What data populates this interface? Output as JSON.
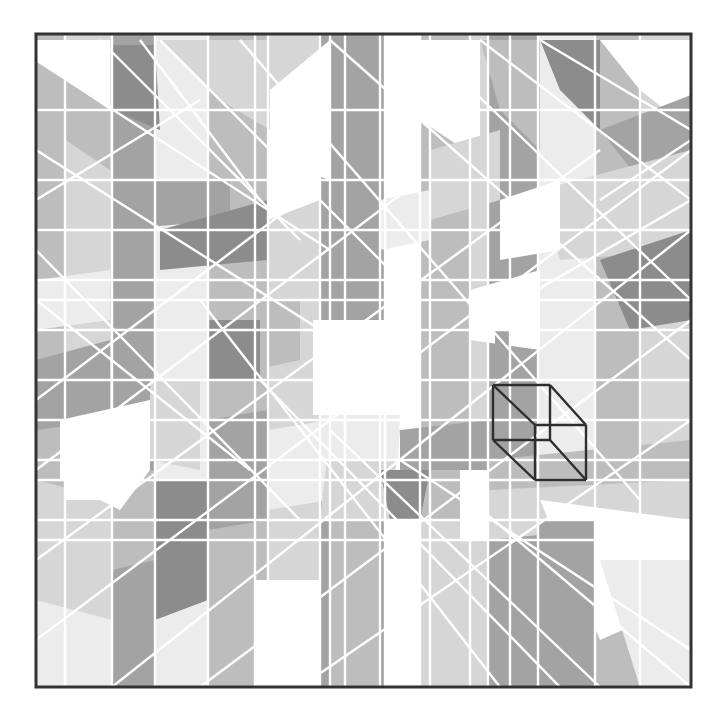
{
  "artwork": {
    "title": "",
    "description": "Abstract geometric composition of gray polygons separated by white lines, with an isometric cube outline",
    "palette": {
      "white": "#ffffff",
      "lightest": "#ececec",
      "light": "#d6d6d6",
      "mid": "#bdbdbd",
      "dark": "#a3a3a3",
      "darkest": "#8c8c8c",
      "line": "#ffffff",
      "frame": "#333333",
      "cube_stroke": "#2e2e2e"
    }
  }
}
